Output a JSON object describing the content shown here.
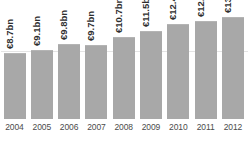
{
  "chart_data": {
    "type": "bar",
    "title": "",
    "xlabel": "",
    "ylabel": "",
    "grid": true,
    "legend": false,
    "ylim": [
      0,
      14.5
    ],
    "gridlines": [
      9.0
    ],
    "categories": [
      "2004",
      "2005",
      "2006",
      "2007",
      "2008",
      "2009",
      "2010",
      "2011",
      "2012"
    ],
    "values": [
      8.7,
      9.1,
      9.8,
      9.7,
      10.7,
      11.5,
      12.4,
      12.8,
      13.3
    ],
    "value_labels": [
      "€8.7bn",
      "€9.1bn",
      "€9.8bn",
      "€9.7bn",
      "€10.7bn",
      "€11.5bn",
      "€12.4bn",
      "€12.8bn",
      "€13.3bn"
    ],
    "units": "€ bn",
    "bar_color": "#a8a8a8",
    "background_color": "#ffffff",
    "grid_color": "#e4e4e4",
    "label_color": "#2e2e2e",
    "tick_color": "#4b4b4b"
  },
  "bars": [
    {
      "year": "2004",
      "label": "€8.7bn",
      "value": 8.7
    },
    {
      "year": "2005",
      "label": "€9.1bn",
      "value": 9.1
    },
    {
      "year": "2006",
      "label": "€9.8bn",
      "value": 9.8
    },
    {
      "year": "2007",
      "label": "€9.7bn",
      "value": 9.7
    },
    {
      "year": "2008",
      "label": "€10.7bn",
      "value": 10.7
    },
    {
      "year": "2009",
      "label": "€11.5bn",
      "value": 11.5
    },
    {
      "year": "2010",
      "label": "€12.4bn",
      "value": 12.4
    },
    {
      "year": "2011",
      "label": "€12.8bn",
      "value": 12.8
    },
    {
      "year": "2012",
      "label": "€13.3bn",
      "value": 13.3
    }
  ]
}
